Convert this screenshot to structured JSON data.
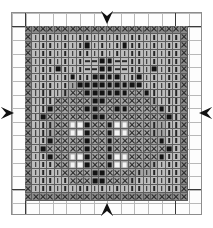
{
  "chart": {
    "kind": "needlework-symbol-chart",
    "grid_columns": 22,
    "grid_rows": 22,
    "canvas_columns": 14,
    "canvas_rows": 15,
    "colors": {
      "paper": "#ffffff",
      "light_grid_line": "#b9b9b9",
      "heavy_grid_line": "#3a3a3a",
      "cell_border": "#5d5d5d",
      "shade_dark": "#8a8a8a",
      "shade_mid": "#a3a3a3",
      "shade_light": "#bdbdbd",
      "symbol_ink": "#131313",
      "symbol_open": "#f4f4f4",
      "marker": "#111111"
    }
  },
  "markers": [
    {
      "name": "center-marker-top",
      "label": "top center marker",
      "direction": "down"
    },
    {
      "name": "center-marker-bottom",
      "label": "bottom center marker",
      "direction": "up"
    },
    {
      "name": "center-marker-left",
      "label": "left center marker",
      "direction": "right"
    },
    {
      "name": "center-marker-right",
      "label": "right center marker",
      "direction": "left"
    }
  ],
  "legend": [
    {
      "symbol": "x",
      "name": "cross-symbol",
      "label": "X"
    },
    {
      "symbol": "bar",
      "name": "vertical-bar-symbol",
      "label": "|"
    },
    {
      "symbol": "dash",
      "name": "horizontal-dash-symbol",
      "label": "-"
    },
    {
      "symbol": "fill",
      "name": "filled-square-symbol",
      "label": "filled"
    },
    {
      "symbol": "open",
      "name": "open-square-symbol",
      "label": "open"
    }
  ],
  "chart_data": {
    "type": "heatmap",
    "xlabel": "",
    "ylabel": "",
    "symbol_key": {
      "x": "cross stitch",
      "b": "vertical bar",
      "d": "horizontal dash",
      "f": "filled square",
      "o": "open square",
      ".": "empty"
    },
    "shade_key": {
      "D": "dark ground",
      "M": "mid ground",
      "L": "light ground"
    },
    "rows": [
      "xxxxxxxxxxxxxxxxxxxxxx",
      "xbbbbbbbbbbbbbbbbbbbbx",
      "xbbbbbbbfbbbbfbbbbbbbx",
      "xbbbbbbbbbbbbbbbbbbbbx",
      "xbbbbbbbddffddbbbbbbbx",
      "xbbbfbbbddffddbbbfbbbx",
      "xbbbbbfbbffffbbfbbbbbx",
      "xbbbbbbfffffffffbbbbbx",
      "xbbbbbxxffffffxxfbbbbx",
      "xbbbxxxxxffxxxxxxbbbbx",
      "xbbfxxxxffxxffxxxxfbbx",
      "xbfxxxxxxffxxxxxxxxfbx",
      "xbbbxxoofxxfooxxxbbbbx",
      "xbbbxxoofxxfooxxxbbbbx",
      "xbbfxxxxfxxfxxxxxxfbbx",
      "xbfxxxxxfxxfxxxxxxxfbx",
      "xbbfxxoofxxfooxxxxfbbx",
      "xbbbxxoofxxfooxxxbbbbx",
      "xbbbbxxxxffxxxxbbbbbbx",
      "xbbbbbxxxffxxxbbbbbbbx",
      "xbbbbbbbbbbbbbbbbbbbbx",
      "xxxxxxxxxxxxxxxxxxxxxx"
    ],
    "shades": [
      "DDDDDDDDDDDDDDDDDDDDDD",
      "DLLLLLLLLLLLLLLLLLLLLD",
      "DLLLLLLLLLLLLLLLLLLLLD",
      "DLLLLLLLLLLLLLLLLLLLLD",
      "DLLLLLLLLLLLLLLLLLLLLD",
      "DLLLLLLLLLLLLLLLLLLLLD",
      "DLLLLLLLLLLLLLLLLLLLLD",
      "DLLLLLMMMMMMMMMLLLLLLD",
      "DLLLLMMMMMMMMMMMMLLLLD",
      "DLLLMMMMMMMMMMMMMMLLLD",
      "DLLMMMMMMMMMMMMMMMMLLD",
      "DLMMMMMMMMMMMMMMMMMMLD",
      "DLLMMMMMMMMMMMMMMMMLLD",
      "DLLMMMMMMMMMMMMMMMMLLD",
      "DLLMMMMMMMMMMMMMMMMLLD",
      "DLMMMMMMMMMMMMMMMMMMLD",
      "DLLMMMMMMMMMMMMMMMMLLD",
      "DLLLMMMMMMMMMMMMMMLLLD",
      "DLLLLMMMMMMMMMMMMLLLLD",
      "DLLLLLMMMMMMMMMLLLLLLD",
      "DLLLLLLLLLLLLLLLLLLLLD",
      "DDDDDDDDDDDDDDDDDDDDDD"
    ]
  }
}
